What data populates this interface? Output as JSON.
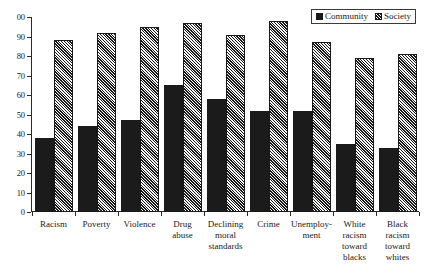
{
  "chart_data": {
    "type": "bar",
    "title": "",
    "subtitle": "",
    "xlabel": "",
    "ylabel": "",
    "ylim": [
      0,
      100
    ],
    "ytick_labels": [
      "00",
      "90",
      "80",
      "70",
      "60",
      "50",
      "40",
      "30",
      "20",
      "10",
      "0"
    ],
    "ytick_values": [
      100,
      90,
      80,
      70,
      60,
      50,
      40,
      30,
      20,
      10,
      0
    ],
    "grid": false,
    "legend_position": "top-right",
    "categories": [
      "Racism",
      "Poverty",
      "Violence",
      "Drug abuse",
      "Declining moral standards",
      "Crime",
      "Unemploy- ment",
      "White racism toward blacks",
      "Black racism toward whites"
    ],
    "series": [
      {
        "name": "Community",
        "fill": "solid-black",
        "color": "#1b1b1b",
        "values": [
          38,
          44,
          47,
          65,
          58,
          52,
          52,
          35,
          33
        ]
      },
      {
        "name": "Society",
        "fill": "diagonal-hatch",
        "color": "#9a9a9a",
        "values": [
          88,
          92,
          95,
          97,
          91,
          98,
          87,
          79,
          81
        ]
      }
    ]
  },
  "legend": {
    "entries": [
      {
        "label": "Community",
        "swatch": "solid-black-swatch"
      },
      {
        "label": "Society",
        "swatch": "hatched-swatch"
      }
    ]
  },
  "axis": {
    "y_labels": [
      "00",
      "90",
      "80",
      "70",
      "60",
      "50",
      "40",
      "30",
      "20",
      "10",
      "0"
    ],
    "x_labels": [
      "Racism",
      "Poverty",
      "Violence",
      "Drug abuse",
      "Declining moral standards",
      "Crime",
      "Unemploy- ment",
      "White racism toward blacks",
      "Black racism toward whites"
    ]
  }
}
